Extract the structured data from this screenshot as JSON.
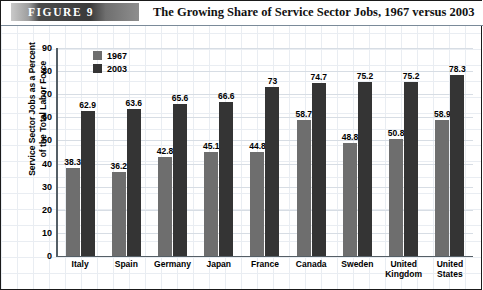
{
  "header": {
    "figure_badge": "FIGURE  9",
    "title": "The Growing Share of Service Sector Jobs, 1967 versus 2003"
  },
  "legend": {
    "items": [
      {
        "label": "1967",
        "color": "#6e6e6e"
      },
      {
        "label": "2003",
        "color": "#343434"
      }
    ]
  },
  "axis": {
    "ylabel_line1": "Service Sector Jobs as a Percent",
    "ylabel_line2": "of the Total Labor Force",
    "yticks": [
      "90",
      "80",
      "70",
      "60",
      "50",
      "40",
      "30",
      "20",
      "10",
      "0"
    ]
  },
  "chart_data": {
    "type": "bar",
    "title": "The Growing Share of Service Sector Jobs, 1967 versus 2003",
    "xlabel": "",
    "ylabel": "Service Sector Jobs as a Percent of the Total Labor Force",
    "ylim": [
      0,
      90
    ],
    "ytick_step": 10,
    "grid": true,
    "legend_position": "top-left-inside",
    "categories": [
      "Italy",
      "Spain",
      "Germany",
      "Japan",
      "France",
      "Canada",
      "Sweden",
      "United Kingdom",
      "United States"
    ],
    "category_display": [
      "Italy",
      "Spain",
      "Germany",
      "Japan",
      "France",
      "Canada",
      "Sweden",
      "United\nKingdom",
      "United\nStates"
    ],
    "series": [
      {
        "name": "1967",
        "color": "#6e6e6e",
        "values": [
          38.3,
          36.2,
          42.8,
          45.1,
          44.8,
          58.7,
          48.8,
          50.8,
          58.9
        ],
        "labels": [
          "38.3",
          "36.2",
          "42.8",
          "45.1",
          "44.8",
          "58.7",
          "48.8",
          "50.8",
          "58.9"
        ]
      },
      {
        "name": "2003",
        "color": "#343434",
        "values": [
          62.9,
          63.6,
          65.6,
          66.6,
          73,
          74.7,
          75.2,
          75.2,
          78.3
        ],
        "labels": [
          "62.9",
          "63.6",
          "65.6",
          "66.6",
          "73",
          "74.7",
          "75.2",
          "75.2",
          "78.3"
        ]
      }
    ]
  }
}
